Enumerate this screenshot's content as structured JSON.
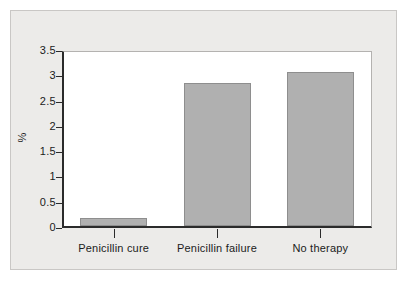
{
  "chart_data": {
    "type": "bar",
    "title": "",
    "xlabel": "",
    "ylabel": "%",
    "categories": [
      "Penicillin cure",
      "Penicillin failure",
      "No therapy"
    ],
    "values": [
      0.16,
      2.82,
      3.05
    ],
    "ylim": [
      0,
      3.5
    ],
    "ytick_labels": [
      "0",
      "0.5",
      "1",
      "1.5",
      "2",
      "2.5",
      "3",
      "3.5"
    ],
    "ytick_values": [
      0,
      0.5,
      1,
      1.5,
      2,
      2.5,
      3,
      3.5
    ],
    "grid": false,
    "legend": "none"
  },
  "style": {
    "bar_fill": "#b0b0b0",
    "bar_stroke": "#8e8e8e",
    "axis_color": "#2b2b2b",
    "frame_color": "#b4b2b0",
    "panel_background": "#ecebe9",
    "panel_border": "#c9c7c5",
    "plot_background": "#ffffff",
    "text_color": "#1b1b1b"
  }
}
